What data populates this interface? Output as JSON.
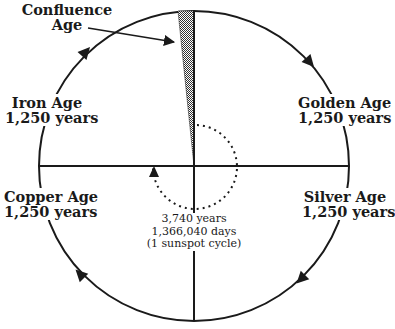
{
  "diagram": {
    "type": "cycle-of-ages",
    "colors": {
      "stroke": "#1a1a1a",
      "background": "#ffffff",
      "hatch": "#555555"
    },
    "confluence": {
      "line1": "Confluence",
      "line2": "Age"
    },
    "ages": {
      "golden": {
        "name": "Golden Age",
        "duration": "1,250 years"
      },
      "silver": {
        "name": "Silver Age",
        "duration": "1,250 years"
      },
      "copper": {
        "name": "Copper Age",
        "duration": "1,250 years"
      },
      "iron": {
        "name": "Iron Age",
        "duration": "1,250 years"
      }
    },
    "cycle": {
      "years": "3,740 years",
      "days": "1,366,040 days",
      "note": "(1 sunspot cycle)"
    },
    "direction": "clockwise"
  }
}
